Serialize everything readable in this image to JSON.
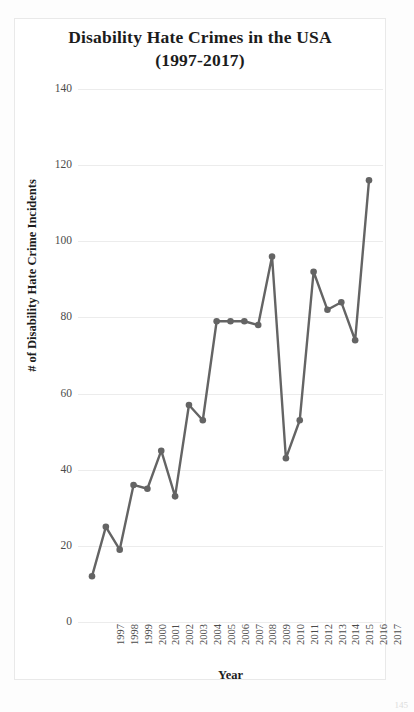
{
  "page": {
    "page_number": "145"
  },
  "chart_data": {
    "type": "line",
    "title": "Disability Hate Crimes in the USA",
    "subtitle": "(1997-2017)",
    "title_line1": "Disability Hate Crimes in the USA",
    "title_line2": "(1997-2017)",
    "xlabel": "Year",
    "ylabel": "# of Disability Hate Crime Incidents",
    "categories": [
      "1997",
      "1998",
      "1999",
      "2000",
      "2001",
      "2002",
      "2003",
      "2004",
      "2005",
      "2006",
      "2007",
      "2008",
      "2009",
      "2010",
      "2011",
      "2012",
      "2013",
      "2014",
      "2015",
      "2016",
      "2017"
    ],
    "values": [
      12,
      25,
      19,
      36,
      35,
      45,
      33,
      57,
      53,
      79,
      79,
      79,
      78,
      96,
      43,
      53,
      92,
      82,
      84,
      74,
      70
    ],
    "series": [
      {
        "name": "# of Disability Hate Crime Incidents",
        "color": "#646464",
        "values": [
          12,
          25,
          19,
          36,
          35,
          45,
          33,
          57,
          53,
          79,
          79,
          79,
          78,
          96,
          43,
          53,
          92,
          82,
          84,
          74,
          70
        ]
      }
    ],
    "ylim": [
      0,
      140
    ],
    "ytick_labels": [
      "0",
      "20",
      "40",
      "60",
      "80",
      "100",
      "120",
      "140"
    ],
    "ytick_values": [
      0,
      20,
      40,
      60,
      80,
      100,
      120,
      140
    ],
    "xtick_labels": [
      "1997",
      "1998",
      "1999",
      "2000",
      "2001",
      "2002",
      "2003",
      "2004",
      "2005",
      "2006",
      "2007",
      "2008",
      "2009",
      "2010",
      "2011",
      "2012",
      "2013",
      "2014",
      "2015",
      "2016",
      "2017"
    ],
    "grid": "horizontal",
    "legend": "none",
    "marker": "circle",
    "line_color": "#646464",
    "grid_color": "#ececec",
    "final_value": 116,
    "final_year": "2017"
  }
}
